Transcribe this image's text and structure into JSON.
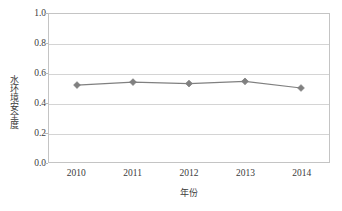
{
  "chart_data": {
    "type": "line",
    "title": "",
    "subtitle": "",
    "xlabel": "年份",
    "ylabel": "水环境安全度",
    "categories": [
      "2010",
      "2011",
      "2012",
      "2013",
      "2014"
    ],
    "x": [
      2010,
      2011,
      2012,
      2013,
      2014
    ],
    "values": [
      0.52,
      0.54,
      0.53,
      0.545,
      0.5
    ],
    "series": [
      {
        "name": "水环境安全度",
        "values": [
          0.52,
          0.54,
          0.53,
          0.545,
          0.5
        ]
      }
    ],
    "ylim": [
      0.0,
      1.0
    ],
    "yticks": [
      0.0,
      0.2,
      0.4,
      0.6,
      0.8,
      1.0
    ],
    "ytick_labels": [
      "0.0",
      "0.2",
      "0.4",
      "0.6",
      "0.8",
      "1.0"
    ],
    "xtick_labels": [
      "2010",
      "2011",
      "2012",
      "2013",
      "2014"
    ],
    "grid": "horizontal",
    "legend": "none",
    "marker": "diamond",
    "colors": {
      "line": "#808080",
      "marker": "#808080",
      "grid": "#d4d4d4",
      "axis": "#c4c4c4",
      "text": "#3b3b3b",
      "background": "#ffffff"
    }
  }
}
